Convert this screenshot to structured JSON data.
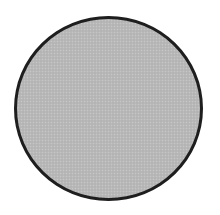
{
  "figure": {
    "shape": "circle",
    "fill_color": "#b9b9b9",
    "stroke_color": "#1e1e1e",
    "stroke_width": 3,
    "background_color": "#ffffff"
  }
}
